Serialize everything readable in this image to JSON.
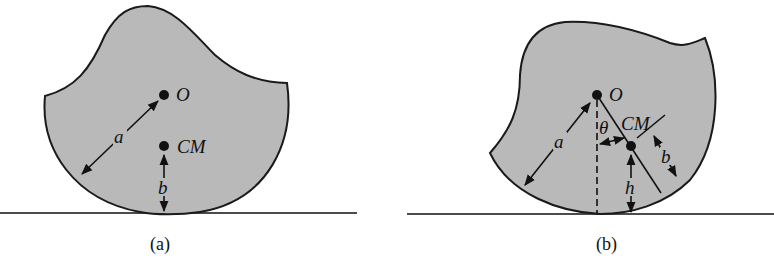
{
  "figure": {
    "panels": [
      {
        "id": "a",
        "caption": "(a)",
        "labels": {
          "pivot": "O",
          "center_of_mass": "CM",
          "radius": "a",
          "cm_height": "b"
        }
      },
      {
        "id": "b",
        "caption": "(b)",
        "labels": {
          "pivot": "O",
          "center_of_mass": "CM",
          "radius": "a",
          "cm_offset": "b",
          "angle": "θ",
          "height": "h"
        }
      }
    ],
    "colors": {
      "fill": "#b9b9b9",
      "stroke": "#1a1a1a",
      "background": "#ffffff"
    }
  }
}
